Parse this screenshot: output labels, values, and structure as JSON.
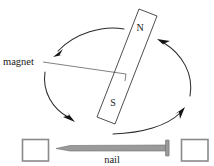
{
  "figure": {
    "canvas": {
      "width": 214,
      "height": 166
    },
    "background_color": "#ffffff"
  },
  "labels": {
    "magnet": "magnet",
    "nail": "nail",
    "north_pole": "N",
    "south_pole": "S"
  },
  "colors": {
    "outline": "#3b3b3b",
    "arrow": "#141414",
    "nail_fill": "#9a9a9a",
    "nail_stroke": "#6e6e6e",
    "box_stroke": "#8a8a8a",
    "text": "#1a1a1a"
  },
  "parts": {
    "magnet_bar": {
      "name": "bar-magnet",
      "orientation_deg": 20,
      "corners": [
        [
          139,
          9
        ],
        [
          157,
          16
        ],
        [
          115,
          124
        ],
        [
          97,
          117
        ]
      ],
      "pole_top": "N",
      "pole_bottom": "S"
    },
    "nail": {
      "name": "nail",
      "tip_x": 56,
      "head_x": 168,
      "axis_y": 148,
      "direction": "point-left"
    },
    "support_box_left": {
      "x": 22,
      "y": 139,
      "w": 26,
      "h": 22
    },
    "support_box_right": {
      "x": 181,
      "y": 139,
      "w": 27,
      "h": 22
    },
    "rotation_arrows": [
      {
        "name": "arrow-top-left",
        "points_to": "down-left"
      },
      {
        "name": "arrow-bottom-left",
        "points_to": "down-right"
      },
      {
        "name": "arrow-bottom-right",
        "points_to": "up-right"
      },
      {
        "name": "arrow-top-right",
        "points_to": "up-left"
      }
    ],
    "leader_line": {
      "from_label": "magnet",
      "to": "magnet-bar"
    }
  }
}
